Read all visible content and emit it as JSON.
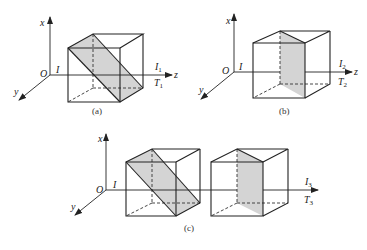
{
  "figures": [
    {
      "id": "a",
      "caption": "(a)",
      "axis_labels": {
        "x": "x",
        "y": "y",
        "z": "z",
        "origin": "O",
        "input": "I",
        "output": "I",
        "output_sub": "1",
        "transmit": "T",
        "transmit_sub": "1"
      },
      "plane": "diagonal"
    },
    {
      "id": "b",
      "caption": "(b)",
      "axis_labels": {
        "x": "x",
        "y": "y",
        "z": "z",
        "origin": "O",
        "input": "I",
        "output": "I",
        "output_sub": "2",
        "transmit": "T",
        "transmit_sub": "2"
      },
      "plane": "vertical"
    },
    {
      "id": "c",
      "caption": "(c)",
      "axis_labels": {
        "x": "x",
        "y": "y",
        "z": "",
        "origin": "O",
        "input": "I",
        "output": "I",
        "output_sub": "3",
        "transmit": "T",
        "transmit_sub": "3"
      },
      "plane": "diagonal + vertical (two cubes in series)"
    }
  ],
  "colors": {
    "line": "#222222",
    "plane_fill": "#d4d4d4",
    "background": "#ffffff"
  }
}
